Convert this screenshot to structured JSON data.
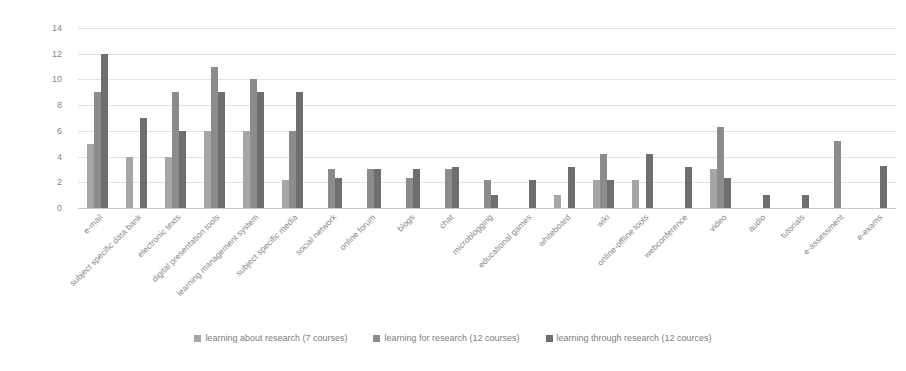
{
  "chart_data": {
    "type": "bar",
    "title": "",
    "subtitle": "",
    "xlabel": "",
    "ylabel": "",
    "ylim": [
      0,
      14
    ],
    "yticks": [
      0,
      2,
      4,
      6,
      8,
      10,
      12,
      14
    ],
    "grid": true,
    "legend_position": "bottom",
    "categories": [
      "e-mail",
      "subject specific data bank",
      "electronic texts",
      "digital presentation tools",
      "learning management system",
      "subject specific media",
      "social network",
      "online forum",
      "blogs",
      "chat",
      "microblogging",
      "educational games",
      "whiteboard",
      "wiki",
      "online-offline tools",
      "webconference",
      "video",
      "audio",
      "tutorials",
      "e-assessment",
      "e-exams"
    ],
    "series": [
      {
        "name": "learning about research (7 courses)",
        "color": "#a6a6a6",
        "values": [
          5,
          4,
          4,
          6,
          6,
          2.2,
          0,
          0,
          0,
          0,
          0,
          0,
          1,
          2.2,
          2.2,
          0,
          3,
          0,
          0,
          0,
          0
        ]
      },
      {
        "name": "learning for research (12 courses)",
        "color": "#8c8c8c",
        "values": [
          9,
          0,
          9,
          11,
          10,
          6,
          3,
          3,
          2.3,
          3,
          2.2,
          0,
          0,
          4.2,
          0,
          0,
          6.3,
          0,
          0,
          5.2,
          0
        ]
      },
      {
        "name": "learning through research (12 cources)",
        "color": "#6e6e6e",
        "values": [
          12,
          7,
          6,
          9,
          9,
          9,
          2.3,
          3,
          3,
          3.2,
          1,
          2.2,
          3.2,
          2.2,
          4.2,
          3.2,
          2.3,
          1,
          1,
          0,
          3.3
        ]
      }
    ]
  },
  "legend": {
    "items": [
      {
        "label": "learning about research (7 courses)",
        "color": "#a6a6a6"
      },
      {
        "label": "learning for research (12 courses)",
        "color": "#8c8c8c"
      },
      {
        "label": "learning through research (12 cources)",
        "color": "#6e6e6e"
      }
    ]
  }
}
